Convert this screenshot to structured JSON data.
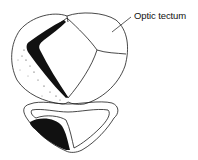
{
  "diagram": {
    "type": "anatomical-cross-section",
    "labels": [
      {
        "text": "Optic tectum",
        "points_to": "right tectal lobe"
      }
    ],
    "colors": {
      "outline": "#1a1a1a",
      "shading": "#111111",
      "background": "#ffffff"
    }
  }
}
